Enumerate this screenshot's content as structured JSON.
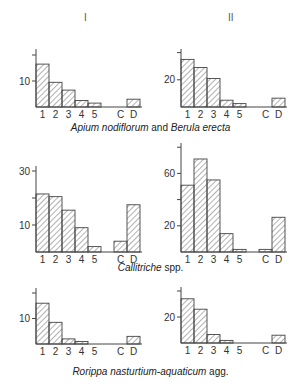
{
  "figure": {
    "column_headers": [
      "I",
      "II"
    ],
    "captions": [
      {
        "italic": "Apium nodiflorum",
        "plain": " and ",
        "italic2": "Berula erecta",
        "plain2": ""
      },
      {
        "italic": "Callitriche",
        "plain": " spp.",
        "italic2": "",
        "plain2": ""
      },
      {
        "italic": "Rorippa nasturtium-aquaticum",
        "plain": "  agg.",
        "italic2": "",
        "plain2": ""
      }
    ],
    "colors": {
      "stroke": "#444444",
      "hatch": "#555555",
      "text": "#333333"
    }
  },
  "chart_data": [
    {
      "type": "bar",
      "panel": "row1-col1",
      "title": "Apium nodiflorum and Berula erecta",
      "column": "I",
      "categories": [
        "1",
        "2",
        "3",
        "4",
        "5",
        "C",
        "D"
      ],
      "values": [
        16.5,
        9.5,
        6.5,
        2.5,
        1.5,
        0,
        3
      ],
      "yticks": [
        10,
        20
      ],
      "ytick_labels": [
        "10",
        ""
      ],
      "ylim": [
        0,
        22
      ],
      "grid": false
    },
    {
      "type": "bar",
      "panel": "row1-col2",
      "title": "Apium nodiflorum and Berula erecta",
      "column": "II",
      "categories": [
        "1",
        "2",
        "3",
        "4",
        "5",
        "C",
        "D"
      ],
      "values": [
        35,
        29,
        21,
        5,
        2.5,
        0,
        6.5
      ],
      "yticks": [
        20,
        40
      ],
      "ytick_labels": [
        "20",
        ""
      ],
      "ylim": [
        0,
        42
      ],
      "grid": false
    },
    {
      "type": "bar",
      "panel": "row2-col1",
      "title": "Callitriche spp.",
      "column": "I",
      "categories": [
        "1",
        "2",
        "3",
        "4",
        "5",
        "C",
        "D"
      ],
      "values": [
        21.5,
        20.5,
        15.5,
        9,
        2,
        4,
        17.5
      ],
      "yticks": [
        10,
        20,
        30
      ],
      "ytick_labels": [
        "10",
        "",
        "30"
      ],
      "ylim": [
        0,
        31
      ],
      "grid": false
    },
    {
      "type": "bar",
      "panel": "row2-col2",
      "title": "Callitriche spp.",
      "column": "II",
      "categories": [
        "1",
        "2",
        "3",
        "4",
        "5",
        "C",
        "D"
      ],
      "values": [
        51,
        71,
        55,
        14,
        2,
        2,
        26.5
      ],
      "yticks": [
        20,
        40,
        60,
        80
      ],
      "ytick_labels": [
        "20",
        "",
        "60",
        ""
      ],
      "ylim": [
        0,
        83
      ],
      "grid": false
    },
    {
      "type": "bar",
      "panel": "row3-col1",
      "title": "Rorippa nasturtium-aquaticum agg.",
      "column": "I",
      "categories": [
        "1",
        "2",
        "3",
        "4",
        "5",
        "C",
        "D"
      ],
      "values": [
        16,
        8.5,
        2,
        1,
        0,
        0,
        3
      ],
      "yticks": [
        10,
        20
      ],
      "ytick_labels": [
        "10",
        ""
      ],
      "ylim": [
        0,
        21
      ],
      "grid": false
    },
    {
      "type": "bar",
      "panel": "row3-col2",
      "title": "Rorippa nasturtium-aquaticum agg.",
      "column": "II",
      "categories": [
        "1",
        "2",
        "3",
        "4",
        "5",
        "C",
        "D"
      ],
      "values": [
        34,
        26,
        6.5,
        2,
        0,
        0,
        6
      ],
      "yticks": [
        20,
        40
      ],
      "ytick_labels": [
        "20",
        ""
      ],
      "ylim": [
        0,
        41
      ],
      "grid": false
    }
  ]
}
